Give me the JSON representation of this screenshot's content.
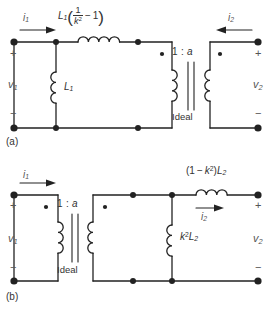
{
  "figure": {
    "stroke_color": "#222222",
    "text_color": "#333333",
    "label_color": "#555555",
    "background": "#ffffff"
  },
  "panels": [
    {
      "id": "panel-a",
      "caption": "(a)",
      "current_in": {
        "symbol": "i",
        "subscript": "1",
        "direction": "right"
      },
      "current_out": {
        "symbol": "i",
        "subscript": "2",
        "direction": "left"
      },
      "voltage_in": {
        "symbol": "v",
        "subscript": "1"
      },
      "voltage_out": {
        "symbol": "v",
        "subscript": "2"
      },
      "polarity_top": "+",
      "polarity_bottom": "−",
      "series_inductor": {
        "name": "series-leakage-inductor",
        "prefix": "L",
        "prefix_sub": "1",
        "numerator": "1",
        "denominator_base": "k",
        "denominator_exp": "2",
        "minus_term": "− 1",
        "full_text": "L₁(1/k² − 1)"
      },
      "shunt_inductor": {
        "name": "magnetizing-inductor",
        "base": "L",
        "sub": "1",
        "full_text": "L₁"
      },
      "transformer": {
        "ratio": "1 : a",
        "ratio_left": "1",
        "ratio_colon": ":",
        "ratio_right": "a",
        "label": "Ideal"
      }
    },
    {
      "id": "panel-b",
      "caption": "(b)",
      "current_in": {
        "symbol": "i",
        "subscript": "1",
        "direction": "right"
      },
      "current_out": {
        "symbol": "i",
        "subscript": "2",
        "direction": "right"
      },
      "voltage_in": {
        "symbol": "v",
        "subscript": "1"
      },
      "voltage_out": {
        "symbol": "v",
        "subscript": "2"
      },
      "polarity_top": "+",
      "polarity_bottom": "−",
      "series_inductor": {
        "name": "secondary-leakage-inductor",
        "open_paren": "(1 − ",
        "base": "k",
        "exp": "2",
        "close_paren": ")",
        "coef_base": "L",
        "coef_sub": "2",
        "full_text": "(1 − k²)L₂"
      },
      "shunt_inductor": {
        "name": "secondary-magnetizing-inductor",
        "base": "k",
        "exp": "2",
        "coef_base": "L",
        "coef_sub": "2",
        "full_text": "k²L₂"
      },
      "transformer": {
        "ratio": "1 : a",
        "ratio_left": "1",
        "ratio_colon": ":",
        "ratio_right": "a",
        "label": "Ideal"
      }
    }
  ]
}
